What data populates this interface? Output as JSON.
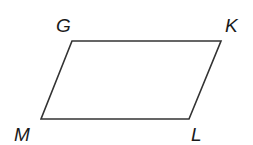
{
  "diagram": {
    "type": "parallelogram",
    "stroke_color": "#333333",
    "background": "#ffffff",
    "vertices": [
      {
        "name": "G",
        "x": 72,
        "y": 41,
        "label_x": 56,
        "label_y": 32
      },
      {
        "name": "K",
        "x": 221,
        "y": 41,
        "label_x": 225,
        "label_y": 32
      },
      {
        "name": "L",
        "x": 189,
        "y": 119,
        "label_x": 191,
        "label_y": 141
      },
      {
        "name": "M",
        "x": 41,
        "y": 119,
        "label_x": 14,
        "label_y": 141
      }
    ],
    "labels": {
      "G": "G",
      "K": "K",
      "L": "L",
      "M": "M"
    }
  }
}
